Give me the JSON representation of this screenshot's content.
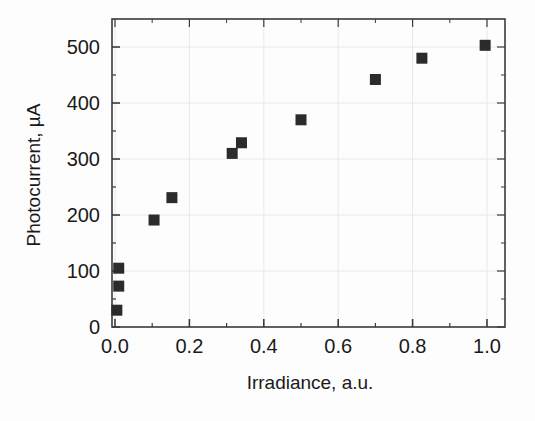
{
  "chart_data": {
    "type": "scatter",
    "title": "",
    "xlabel": "Irradiance, a.u.",
    "ylabel": "Photocurrent, µA",
    "xlim": [
      -0.05,
      1.05
    ],
    "ylim": [
      -20,
      540
    ],
    "xticks": [
      0.0,
      0.2,
      0.4,
      0.6,
      0.8,
      1.0
    ],
    "xtick_labels": [
      "0.0",
      "0.2",
      "0.4",
      "0.6",
      "0.8",
      "1.0"
    ],
    "yticks": [
      0,
      100,
      200,
      300,
      400,
      500
    ],
    "ytick_labels": [
      "0",
      "100",
      "200",
      "300",
      "400",
      "500"
    ],
    "minor_ticks": true,
    "grid": true,
    "grid_color": "#e8e8e8",
    "legend": null,
    "marker": "square",
    "marker_color": "#2b2b2b",
    "marker_size": 11,
    "series": [
      {
        "name": "Photocurrent vs Irradiance",
        "x": [
          0.01,
          0.01,
          0.005,
          0.105,
          0.153,
          0.315,
          0.34,
          0.5,
          0.7,
          0.825,
          0.995
        ],
        "y": [
          105,
          73,
          30,
          191,
          231,
          310,
          329,
          370,
          442,
          480,
          503
        ],
        "points": [
          {
            "x": 0.01,
            "y": 105
          },
          {
            "x": 0.01,
            "y": 73
          },
          {
            "x": 0.005,
            "y": 30
          },
          {
            "x": 0.105,
            "y": 191
          },
          {
            "x": 0.153,
            "y": 231
          },
          {
            "x": 0.315,
            "y": 310
          },
          {
            "x": 0.34,
            "y": 329
          },
          {
            "x": 0.5,
            "y": 370
          },
          {
            "x": 0.7,
            "y": 442
          },
          {
            "x": 0.825,
            "y": 480
          },
          {
            "x": 0.995,
            "y": 503
          }
        ]
      }
    ]
  },
  "colors": {
    "marker": "#2b2b2b",
    "axis": "#3a3a3a",
    "grid": "#ebebeb",
    "background": "#fdfdfd",
    "text": "#1a1a1a"
  }
}
